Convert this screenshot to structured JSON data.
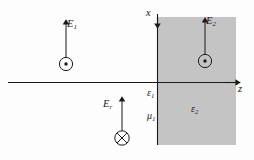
{
  "figure": {
    "background_color": "#fdfdfd",
    "line_color": "#1a1a1a",
    "shaded_region_color": "#c4c4c4"
  },
  "axes": {
    "vertical": {
      "name": "x-axis",
      "label_base": "x",
      "label_sub": ""
    },
    "horizontal": {
      "name": "z-axis",
      "label_base": "z",
      "label_sub": ""
    }
  },
  "fields": [
    {
      "name": "incident-field",
      "label_base": "E",
      "label_sub": "1",
      "arrow_direction": "up",
      "marker": "circle-dot",
      "marker_meaning": "out-of-page",
      "region": "medium-1"
    },
    {
      "name": "transmitted-field",
      "label_base": "E",
      "label_sub": "2",
      "arrow_direction": "up",
      "marker": "circle-dot",
      "marker_meaning": "out-of-page",
      "region": "medium-2"
    },
    {
      "name": "reflected-field",
      "label_base": "E",
      "label_sub": "r",
      "arrow_direction": "up",
      "marker": "circle-cross",
      "marker_meaning": "into-page",
      "region": "medium-1"
    }
  ],
  "materials": [
    {
      "name": "permittivity-medium-1",
      "label_base": "ε",
      "label_sub": "1"
    },
    {
      "name": "permeability-medium-1",
      "label_base": "μ",
      "label_sub": "1"
    },
    {
      "name": "permittivity-medium-2",
      "label_base": "ε",
      "label_sub": "2"
    }
  ]
}
